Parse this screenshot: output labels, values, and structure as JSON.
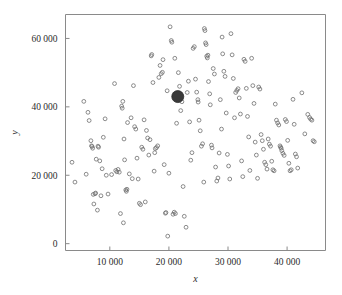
{
  "chart_data": {
    "type": "scatter",
    "title": "",
    "subtitle": "",
    "xlabel": "x",
    "ylabel": "y",
    "xlim": [
      2500,
      46500
    ],
    "ylim": [
      -2000,
      67000
    ],
    "grid": false,
    "legend": null,
    "x_ticks": [
      10000,
      20000,
      30000,
      40000
    ],
    "x_tick_labels": [
      "10 000",
      "20 000",
      "30 000",
      "40 000"
    ],
    "y_ticks": [
      0,
      20000,
      40000,
      60000
    ],
    "y_tick_labels": [
      "0",
      "20 000",
      "40 000",
      "60 000"
    ],
    "marker": "open-circle",
    "marker_color": "#6e6e6e",
    "dense_cluster": {
      "x": 21500,
      "y": 43000,
      "radius_px": 6,
      "color": "#3a3a3a",
      "note": "overplotted mass of coincident points"
    },
    "points": [
      [
        3600,
        23800
      ],
      [
        4100,
        18000
      ],
      [
        5600,
        41600
      ],
      [
        6000,
        20300
      ],
      [
        6300,
        38400
      ],
      [
        6500,
        36000
      ],
      [
        6800,
        30100
      ],
      [
        6900,
        28600
      ],
      [
        7000,
        28400
      ],
      [
        7100,
        27900
      ],
      [
        7200,
        14400
      ],
      [
        7300,
        11600
      ],
      [
        7500,
        14600
      ],
      [
        7600,
        14800
      ],
      [
        7700,
        24700
      ],
      [
        7900,
        9800
      ],
      [
        8000,
        28500
      ],
      [
        8100,
        28200
      ],
      [
        8300,
        24200
      ],
      [
        8500,
        14000
      ],
      [
        8700,
        21900
      ],
      [
        8900,
        31100
      ],
      [
        9200,
        36500
      ],
      [
        9400,
        20000
      ],
      [
        9700,
        14500
      ],
      [
        10300,
        20200
      ],
      [
        10800,
        46800
      ],
      [
        11000,
        21400
      ],
      [
        11200,
        21000
      ],
      [
        11400,
        21700
      ],
      [
        11600,
        20900
      ],
      [
        11800,
        8800
      ],
      [
        12000,
        40200
      ],
      [
        12100,
        39600
      ],
      [
        12200,
        41600
      ],
      [
        12300,
        6100
      ],
      [
        12400,
        30600
      ],
      [
        12500,
        24500
      ],
      [
        12700,
        15700
      ],
      [
        12800,
        15300
      ],
      [
        12900,
        15900
      ],
      [
        13000,
        35400
      ],
      [
        13300,
        20400
      ],
      [
        13600,
        36800
      ],
      [
        13800,
        19000
      ],
      [
        14000,
        46200
      ],
      [
        14200,
        34200
      ],
      [
        14400,
        33500
      ],
      [
        14600,
        25000
      ],
      [
        14800,
        18900
      ],
      [
        15000,
        11800
      ],
      [
        15200,
        11400
      ],
      [
        15400,
        28200
      ],
      [
        15600,
        27600
      ],
      [
        15800,
        36200
      ],
      [
        16000,
        12200
      ],
      [
        16200,
        33100
      ],
      [
        16400,
        30900
      ],
      [
        16600,
        25900
      ],
      [
        16800,
        30400
      ],
      [
        17000,
        54900
      ],
      [
        17100,
        55300
      ],
      [
        17300,
        47100
      ],
      [
        17500,
        21200
      ],
      [
        17600,
        26600
      ],
      [
        17700,
        27800
      ],
      [
        17900,
        28100
      ],
      [
        18100,
        28600
      ],
      [
        18300,
        48600
      ],
      [
        18500,
        52100
      ],
      [
        18700,
        49700
      ],
      [
        18900,
        50100
      ],
      [
        19000,
        53800
      ],
      [
        19200,
        23100
      ],
      [
        19400,
        8900
      ],
      [
        19500,
        9100
      ],
      [
        19700,
        44700
      ],
      [
        19800,
        2200
      ],
      [
        20000,
        20600
      ],
      [
        20200,
        63400
      ],
      [
        20400,
        59400
      ],
      [
        20500,
        58900
      ],
      [
        20700,
        8600
      ],
      [
        20900,
        9200
      ],
      [
        21000,
        54200
      ],
      [
        21100,
        8800
      ],
      [
        21300,
        35200
      ],
      [
        21600,
        50000
      ],
      [
        21800,
        46000
      ],
      [
        22000,
        38900
      ],
      [
        22200,
        41500
      ],
      [
        22400,
        16700
      ],
      [
        22600,
        8000
      ],
      [
        22900,
        4800
      ],
      [
        23100,
        44200
      ],
      [
        23300,
        47500
      ],
      [
        23500,
        35600
      ],
      [
        23700,
        24400
      ],
      [
        23900,
        26600
      ],
      [
        24100,
        57100
      ],
      [
        24300,
        57600
      ],
      [
        24500,
        48100
      ],
      [
        24700,
        44300
      ],
      [
        24900,
        42100
      ],
      [
        24950,
        41400
      ],
      [
        25100,
        36100
      ],
      [
        25300,
        33000
      ],
      [
        25500,
        28500
      ],
      [
        25700,
        29200
      ],
      [
        25900,
        18000
      ],
      [
        26000,
        62900
      ],
      [
        26100,
        62300
      ],
      [
        26200,
        58700
      ],
      [
        26300,
        58200
      ],
      [
        26400,
        54800
      ],
      [
        26500,
        54300
      ],
      [
        26600,
        55100
      ],
      [
        26700,
        47400
      ],
      [
        26900,
        43800
      ],
      [
        27000,
        40600
      ],
      [
        27200,
        28800
      ],
      [
        27300,
        28000
      ],
      [
        27500,
        51200
      ],
      [
        27700,
        49600
      ],
      [
        27900,
        22400
      ],
      [
        28100,
        18300
      ],
      [
        28300,
        19200
      ],
      [
        28500,
        26500
      ],
      [
        28700,
        42100
      ],
      [
        28900,
        33500
      ],
      [
        29000,
        60400
      ],
      [
        29100,
        55500
      ],
      [
        29300,
        50400
      ],
      [
        29500,
        48900
      ],
      [
        29700,
        38200
      ],
      [
        29900,
        26100
      ],
      [
        30100,
        22700
      ],
      [
        30300,
        18900
      ],
      [
        30500,
        61400
      ],
      [
        30700,
        55200
      ],
      [
        30900,
        48300
      ],
      [
        31100,
        36800
      ],
      [
        31300,
        44200
      ],
      [
        31500,
        44800
      ],
      [
        31700,
        45300
      ],
      [
        31900,
        42600
      ],
      [
        32100,
        37900
      ],
      [
        32300,
        24200
      ],
      [
        32500,
        19600
      ],
      [
        32700,
        53900
      ],
      [
        32900,
        53300
      ],
      [
        33100,
        45400
      ],
      [
        33300,
        37200
      ],
      [
        33500,
        31200
      ],
      [
        33700,
        21400
      ],
      [
        34000,
        54200
      ],
      [
        34200,
        46200
      ],
      [
        34400,
        41000
      ],
      [
        34600,
        29700
      ],
      [
        34800,
        25900
      ],
      [
        35000,
        19100
      ],
      [
        35200,
        45800
      ],
      [
        35400,
        45200
      ],
      [
        35600,
        31900
      ],
      [
        35800,
        30100
      ],
      [
        36000,
        27600
      ],
      [
        36200,
        23800
      ],
      [
        36400,
        23100
      ],
      [
        36600,
        21800
      ],
      [
        36800,
        30600
      ],
      [
        37000,
        29100
      ],
      [
        37200,
        28500
      ],
      [
        37400,
        24100
      ],
      [
        37600,
        21600
      ],
      [
        37800,
        21300
      ],
      [
        38000,
        40800
      ],
      [
        38200,
        36100
      ],
      [
        38400,
        35300
      ],
      [
        38600,
        34700
      ],
      [
        38800,
        28600
      ],
      [
        38900,
        28200
      ],
      [
        39000,
        27900
      ],
      [
        39100,
        27200
      ],
      [
        39300,
        26400
      ],
      [
        39500,
        25800
      ],
      [
        39700,
        36300
      ],
      [
        39900,
        35700
      ],
      [
        40100,
        30200
      ],
      [
        40300,
        23500
      ],
      [
        40500,
        21300
      ],
      [
        40700,
        21600
      ],
      [
        41000,
        42200
      ],
      [
        41200,
        34900
      ],
      [
        41400,
        26200
      ],
      [
        41600,
        25400
      ],
      [
        41800,
        22100
      ],
      [
        42500,
        44100
      ],
      [
        43000,
        32100
      ],
      [
        43500,
        37800
      ],
      [
        43800,
        36900
      ],
      [
        44000,
        36400
      ],
      [
        44200,
        36100
      ],
      [
        44400,
        30100
      ],
      [
        44600,
        29800
      ]
    ]
  },
  "axes": {
    "x_axis_name": "x-axis",
    "y_axis_name": "y-axis"
  }
}
